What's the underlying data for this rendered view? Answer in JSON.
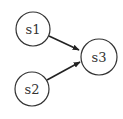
{
  "diagram": {
    "type": "directed-graph",
    "nodes": [
      {
        "id": "s1",
        "label": "s1"
      },
      {
        "id": "s2",
        "label": "s2"
      },
      {
        "id": "s3",
        "label": "s3"
      }
    ],
    "edges": [
      {
        "from": "s1",
        "to": "s3"
      },
      {
        "from": "s2",
        "to": "s3"
      }
    ]
  }
}
